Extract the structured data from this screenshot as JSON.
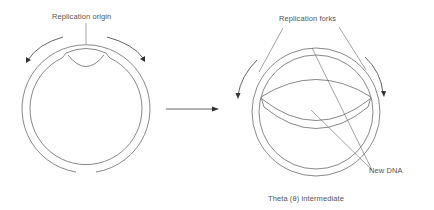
{
  "diagram": {
    "left_panel": {
      "label_origin": "Replication origin",
      "description": "Circular double-stranded DNA with replication bubble opened at origin; arrows show bidirectional replication"
    },
    "transition_arrow": "right-arrow",
    "right_panel": {
      "label_forks": "Replication forks",
      "label_new_dna": "New DNA",
      "caption": "Theta (θ) intermediate"
    },
    "colors": {
      "strand": "#7a7a7a",
      "arrow": "#555555",
      "text": "#555555",
      "background": "#ffffff"
    }
  }
}
